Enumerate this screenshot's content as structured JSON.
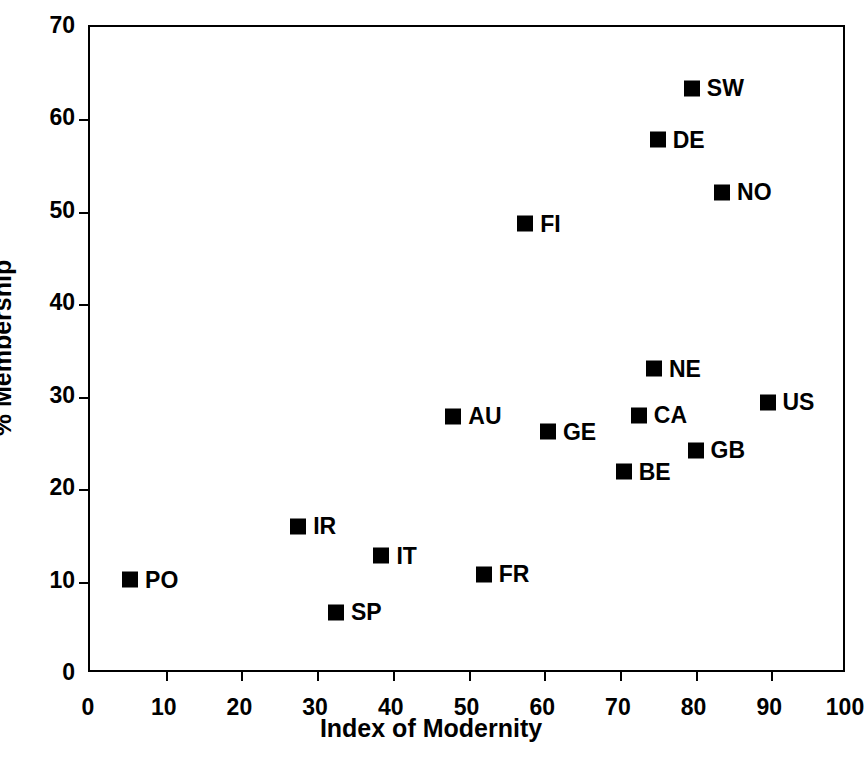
{
  "chart_data": {
    "type": "scatter",
    "title": "",
    "xlabel": "Index of Modernity",
    "ylabel": "% Membership",
    "xlim": [
      0,
      100
    ],
    "ylim": [
      0,
      70
    ],
    "xticks": [
      0,
      10,
      20,
      30,
      40,
      50,
      60,
      70,
      80,
      90,
      100
    ],
    "yticks": [
      0,
      10,
      20,
      30,
      40,
      50,
      60,
      70
    ],
    "grid": false,
    "legend": "none",
    "marker_color": "#000000",
    "points": [
      {
        "label": "PO",
        "x": 5.3,
        "y": 10.2
      },
      {
        "label": "IR",
        "x": 27.5,
        "y": 16.0
      },
      {
        "label": "SP",
        "x": 32.5,
        "y": 6.7
      },
      {
        "label": "IT",
        "x": 38.5,
        "y": 12.8
      },
      {
        "label": "AU",
        "x": 48.0,
        "y": 27.9
      },
      {
        "label": "FR",
        "x": 52.0,
        "y": 10.8
      },
      {
        "label": "FI",
        "x": 57.5,
        "y": 48.7
      },
      {
        "label": "GE",
        "x": 60.5,
        "y": 26.2
      },
      {
        "label": "BE",
        "x": 70.5,
        "y": 21.9
      },
      {
        "label": "CA",
        "x": 72.5,
        "y": 28.0
      },
      {
        "label": "NE",
        "x": 74.5,
        "y": 33.0
      },
      {
        "label": "DE",
        "x": 75.0,
        "y": 57.8
      },
      {
        "label": "SW",
        "x": 79.5,
        "y": 63.4
      },
      {
        "label": "GB",
        "x": 80.0,
        "y": 24.2
      },
      {
        "label": "NO",
        "x": 83.5,
        "y": 52.1
      },
      {
        "label": "US",
        "x": 89.5,
        "y": 29.4
      }
    ]
  },
  "axes": {
    "x_title": "Index of Modernity",
    "y_title": "% Membership"
  }
}
